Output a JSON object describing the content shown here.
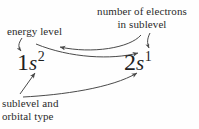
{
  "figure": {
    "background_color": "#fefefe",
    "text_color": "#2b2b2b",
    "line_color": "#4a4a4a"
  },
  "configurations": [
    {
      "id": "left",
      "full": "1s2",
      "energy_level": "1",
      "orbital_type": "s",
      "electron_count": "2"
    },
    {
      "id": "right",
      "full": "2s1",
      "energy_level": "2",
      "orbital_type": "s",
      "electron_count": "1"
    }
  ],
  "labels": {
    "energy_level": {
      "line1": "energy level"
    },
    "number_of_electrons": {
      "line1": "number of electrons",
      "line2": "in sublevel"
    },
    "sublevel_and_orbital_type": {
      "line1": "sublevel and",
      "line2": "orbital type"
    }
  }
}
